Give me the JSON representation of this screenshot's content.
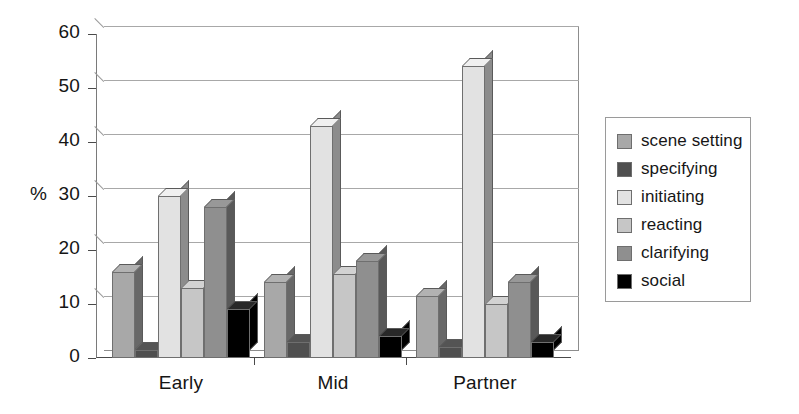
{
  "chart_data": {
    "type": "bar",
    "title": "",
    "subtitle": "",
    "xlabel": "",
    "ylabel": "%",
    "ylim": [
      0,
      60
    ],
    "ytick_labels": [
      "0",
      "10",
      "20",
      "30",
      "40",
      "50",
      "60"
    ],
    "ytick_values": [
      0,
      10,
      20,
      30,
      40,
      50,
      60
    ],
    "grid": true,
    "grid_axis": "y",
    "legend_position": "right",
    "style": "3d-grouped-columns",
    "categories": [
      "Early",
      "Mid",
      "Partner"
    ],
    "series": [
      {
        "name": "scene setting",
        "color": "#a8a8a8",
        "values": [
          16,
          14,
          11.5
        ]
      },
      {
        "name": "specifying",
        "color": "#4f4f4f",
        "values": [
          1.5,
          3,
          2
        ]
      },
      {
        "name": "initiating",
        "color": "#e2e2e2",
        "values": [
          30,
          43,
          54
        ]
      },
      {
        "name": "reacting",
        "color": "#c6c6c6",
        "values": [
          13,
          15.5,
          10
        ]
      },
      {
        "name": "clarifying",
        "color": "#8f8f8f",
        "values": [
          28,
          18,
          14
        ]
      },
      {
        "name": "social",
        "color": "#000000",
        "values": [
          9,
          4,
          3
        ]
      }
    ]
  },
  "legend": {
    "items": [
      {
        "label": "scene setting",
        "swatch": "legend-swatch-scene-setting"
      },
      {
        "label": "specifying",
        "swatch": "legend-swatch-specifying"
      },
      {
        "label": "initiating",
        "swatch": "legend-swatch-initiating"
      },
      {
        "label": "reacting",
        "swatch": "legend-swatch-reacting"
      },
      {
        "label": "clarifying",
        "swatch": "legend-swatch-clarifying"
      },
      {
        "label": "social",
        "swatch": "legend-swatch-social"
      }
    ]
  },
  "axis": {
    "y_unit_label": "%",
    "y_labels": [
      "60",
      "50",
      "40",
      "30",
      "20",
      "10",
      "0"
    ],
    "x_labels": [
      "Early",
      "Mid",
      "Partner"
    ]
  },
  "colors": {
    "scene_setting": "#a8a8a8",
    "specifying": "#4f4f4f",
    "initiating": "#e2e2e2",
    "reacting": "#c6c6c6",
    "clarifying": "#8f8f8f",
    "social": "#000000",
    "grid": "#a8a8a8",
    "axis": "#4a4a4a",
    "background": "#ffffff"
  }
}
